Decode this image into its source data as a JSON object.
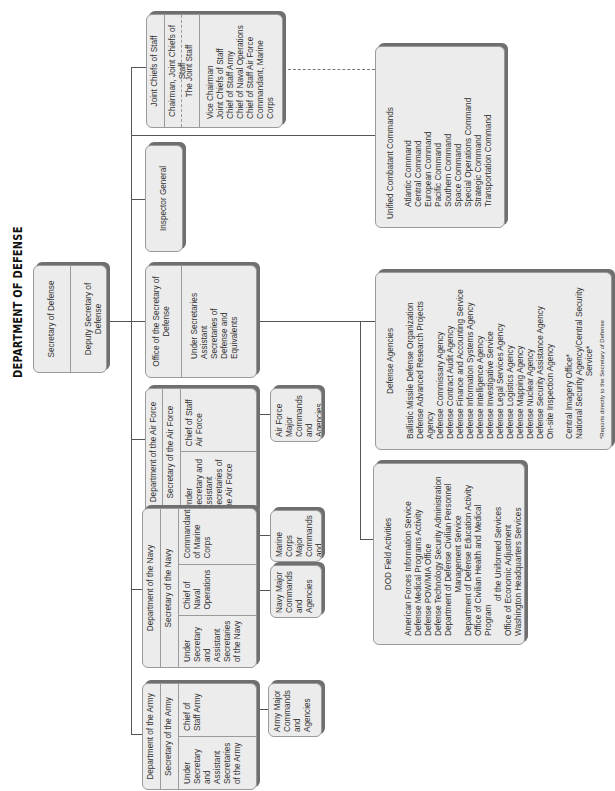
{
  "title": "DEPARTMENT OF DEFENSE",
  "secdef": {
    "title": "Secretary of Defense",
    "deputy": "Deputy Secretary of Defense"
  },
  "jcs": {
    "title": "Joint Chiefs of Staff",
    "chairman": "Chairman, Joint Chiefs of Staff",
    "joint_staff": "The Joint Staff",
    "members": [
      "Vice Chairman",
      "Joint Chiefs of Staff",
      "Chief of Staff Army",
      "Chief of Naval Operations",
      "Chief of Staff Air Force",
      "Commandant, Marine Corps"
    ]
  },
  "inspector_general": {
    "title": "Inspector General"
  },
  "osd": {
    "title": "Office of the Secretary of Defense",
    "members": "Under Secretaries Assistant Secretaries of Defense and Equivalents"
  },
  "unified_combatant": {
    "title": "Unified Combatant Commands",
    "items": [
      "Atlantic Command",
      "Central Command",
      "European Command",
      "Pacific Command",
      "Southern Command",
      "Space Command",
      "Special Operations Command",
      "Strategic Command",
      "Transportation Command"
    ]
  },
  "defense_agencies": {
    "title": "Defense Agencies",
    "items": [
      "Ballistic Missile Defense Organization",
      "Defense Advanced Research Projects Agency",
      "Defense Commissary Agency",
      "Defense Contract Audit Agency",
      "Defense Finance and Accounting Service",
      "Defense Information Systems Agency",
      "Defense Intelligence Agency",
      "Defense Investigative Service",
      "Defense Legal Services Agency",
      "Defense Logistics Agency",
      "Defense Mapping Agency",
      "Defense Nuclear Agency",
      "Defense Security Assistance Agency",
      "On-site Inspection Agency"
    ],
    "extra": [
      "Central Imagery Office*",
      "National Security Agency/Central Security",
      "Service*"
    ],
    "footnote": "*Reports directly to the Secretary of Defense"
  },
  "field_activities": {
    "title": "DOD Field Activities",
    "items": [
      "American Forces Information Service",
      "Defense Medical Programs Activity",
      "Defense POW/MIA Office",
      "Defense Technology Security Administration",
      "Department of Defense Civilian Personnel",
      "Management Service",
      "Department of Defense Education Activity",
      "Office of Civilian Health and Medical Program",
      "of the Uniformed Services",
      "Office of Economic Adjustment",
      "Washington Headquarters Services"
    ]
  },
  "air_force": {
    "title": "Department of the Air Force",
    "secretary": "Secretary of the Air Force",
    "col1": "Under Secretary and Assistant Secretaries of the Air Force",
    "col2": "Chief of Staff Air Force",
    "major": "Air Force Major Commands and Agencies"
  },
  "navy": {
    "title": "Department of the Navy",
    "secretary": "Secretary of the Navy",
    "col1": "Under Secretary and Assistant Secretaries of the Navy",
    "col2": "Chief of Naval Operations",
    "col3": "Commandant of Marine Corps",
    "navy_major": "Navy Major Commands and Agencies",
    "marine_major": "Marine Corps Major Commands and Agencies"
  },
  "army": {
    "title": "Department of the Army",
    "secretary": "Secretary of the Army",
    "col1": "Under Secretary and Assistant Secretaries of the Army",
    "col2": "Chief of Staff Army",
    "major": "Army Major Commands and Agencies"
  }
}
